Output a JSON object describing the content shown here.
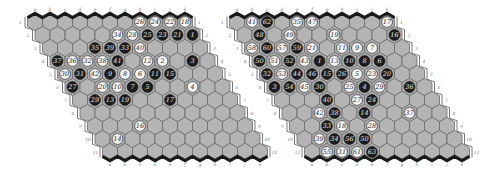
{
  "figure": {
    "boards": [
      {
        "id": "left",
        "size": 11,
        "origin_x": 35,
        "origin_y": 22,
        "columns": [
          "a",
          "b",
          "c",
          "d",
          "e",
          "f",
          "g",
          "h",
          "i",
          "j",
          "k"
        ],
        "rows": [
          "1",
          "2",
          "3",
          "4",
          "5",
          "6",
          "7",
          "8",
          "9",
          "10",
          "11"
        ],
        "stones": [
          {
            "row": 1,
            "col": "h",
            "color": "white",
            "n": "26"
          },
          {
            "row": 1,
            "col": "i",
            "color": "white",
            "n": "24"
          },
          {
            "row": 1,
            "col": "j",
            "color": "white",
            "n": "22"
          },
          {
            "row": 1,
            "col": "k",
            "color": "white",
            "n": "18"
          },
          {
            "row": 2,
            "col": "f",
            "color": "white",
            "n": "34"
          },
          {
            "row": 2,
            "col": "g",
            "color": "white",
            "n": "28"
          },
          {
            "row": 2,
            "col": "h",
            "color": "black",
            "n": "25"
          },
          {
            "row": 2,
            "col": "i",
            "color": "black",
            "n": "23"
          },
          {
            "row": 2,
            "col": "j",
            "color": "black",
            "n": "21"
          },
          {
            "row": 2,
            "col": "k",
            "color": "black",
            "n": "1"
          },
          {
            "row": 3,
            "col": "d",
            "color": "black",
            "n": "35"
          },
          {
            "row": 3,
            "col": "e",
            "color": "black",
            "n": "39"
          },
          {
            "row": 3,
            "col": "f",
            "color": "black",
            "n": "33"
          },
          {
            "row": 3,
            "col": "g",
            "color": "white",
            "n": "40"
          },
          {
            "row": 4,
            "col": "a",
            "color": "black",
            "n": "37"
          },
          {
            "row": 4,
            "col": "b",
            "color": "white",
            "n": "36"
          },
          {
            "row": 4,
            "col": "c",
            "color": "white",
            "n": "32"
          },
          {
            "row": 4,
            "col": "d",
            "color": "white",
            "n": "38"
          },
          {
            "row": 4,
            "col": "e",
            "color": "black",
            "n": "41"
          },
          {
            "row": 4,
            "col": "g",
            "color": "white",
            "n": "12"
          },
          {
            "row": 4,
            "col": "h",
            "color": "white",
            "n": "2"
          },
          {
            "row": 4,
            "col": "j",
            "color": "black",
            "n": "3"
          },
          {
            "row": 5,
            "col": "a",
            "color": "white",
            "n": "30"
          },
          {
            "row": 5,
            "col": "b",
            "color": "black",
            "n": "31"
          },
          {
            "row": 5,
            "col": "c",
            "color": "white",
            "n": "42"
          },
          {
            "row": 5,
            "col": "d",
            "color": "black",
            "n": "9"
          },
          {
            "row": 5,
            "col": "e",
            "color": "white",
            "n": "8"
          },
          {
            "row": 5,
            "col": "f",
            "color": "white",
            "n": "6"
          },
          {
            "row": 5,
            "col": "g",
            "color": "black",
            "n": "11"
          },
          {
            "row": 5,
            "col": "h",
            "color": "black",
            "n": "15"
          },
          {
            "row": 6,
            "col": "a",
            "color": "black",
            "n": "27"
          },
          {
            "row": 6,
            "col": "c",
            "color": "white",
            "n": "20"
          },
          {
            "row": 6,
            "col": "d",
            "color": "white",
            "n": "10"
          },
          {
            "row": 6,
            "col": "e",
            "color": "black",
            "n": "7"
          },
          {
            "row": 6,
            "col": "f",
            "color": "black",
            "n": "5"
          },
          {
            "row": 6,
            "col": "i",
            "color": "white",
            "n": "4"
          },
          {
            "row": 7,
            "col": "b",
            "color": "black",
            "n": "29"
          },
          {
            "row": 7,
            "col": "c",
            "color": "black",
            "n": "13"
          },
          {
            "row": 7,
            "col": "d",
            "color": "black",
            "n": "19"
          },
          {
            "row": 7,
            "col": "g",
            "color": "black",
            "n": "17"
          },
          {
            "row": 9,
            "col": "d",
            "color": "white",
            "n": "16"
          },
          {
            "row": 10,
            "col": "b",
            "color": "white",
            "n": "14"
          }
        ]
      },
      {
        "id": "right",
        "size": 11,
        "origin_x": 237,
        "origin_y": 22,
        "columns": [
          "a",
          "b",
          "c",
          "d",
          "e",
          "f",
          "g",
          "h",
          "i",
          "j",
          "k"
        ],
        "rows": [
          "1",
          "2",
          "3",
          "4",
          "5",
          "6",
          "7",
          "8",
          "9",
          "10",
          "11"
        ],
        "stones": [
          {
            "row": 1,
            "col": "b",
            "color": "white",
            "n": "41"
          },
          {
            "row": 1,
            "col": "c",
            "color": "black",
            "n": "62"
          },
          {
            "row": 1,
            "col": "e",
            "color": "white",
            "n": "35"
          },
          {
            "row": 1,
            "col": "f",
            "color": "white",
            "n": "47"
          },
          {
            "row": 1,
            "col": "k",
            "color": "white",
            "n": "17"
          },
          {
            "row": 2,
            "col": "b",
            "color": "black",
            "n": "48"
          },
          {
            "row": 2,
            "col": "d",
            "color": "white",
            "n": "49"
          },
          {
            "row": 2,
            "col": "g",
            "color": "white",
            "n": "19"
          },
          {
            "row": 2,
            "col": "k",
            "color": "black",
            "n": "16"
          },
          {
            "row": 3,
            "col": "a",
            "color": "white",
            "n": "58"
          },
          {
            "row": 3,
            "col": "b",
            "color": "black",
            "n": "60"
          },
          {
            "row": 3,
            "col": "c",
            "color": "white",
            "n": "57"
          },
          {
            "row": 3,
            "col": "d",
            "color": "black",
            "n": "59"
          },
          {
            "row": 3,
            "col": "e",
            "color": "white",
            "n": "21"
          },
          {
            "row": 3,
            "col": "g",
            "color": "white",
            "n": "11"
          },
          {
            "row": 3,
            "col": "h",
            "color": "white",
            "n": "9"
          },
          {
            "row": 3,
            "col": "i",
            "color": "white",
            "n": "7"
          },
          {
            "row": 4,
            "col": "a",
            "color": "black",
            "n": "50"
          },
          {
            "row": 4,
            "col": "b",
            "color": "white",
            "n": "51"
          },
          {
            "row": 4,
            "col": "c",
            "color": "black",
            "n": "52"
          },
          {
            "row": 4,
            "col": "d",
            "color": "white",
            "n": "43"
          },
          {
            "row": 4,
            "col": "e",
            "color": "black",
            "n": "1"
          },
          {
            "row": 4,
            "col": "f",
            "color": "white",
            "n": "13"
          },
          {
            "row": 4,
            "col": "g",
            "color": "black",
            "n": "10"
          },
          {
            "row": 4,
            "col": "h",
            "color": "black",
            "n": "8"
          },
          {
            "row": 4,
            "col": "i",
            "color": "black",
            "n": "6"
          },
          {
            "row": 5,
            "col": "a",
            "color": "black",
            "n": "32"
          },
          {
            "row": 5,
            "col": "b",
            "color": "white",
            "n": "53"
          },
          {
            "row": 5,
            "col": "c",
            "color": "black",
            "n": "44"
          },
          {
            "row": 5,
            "col": "d",
            "color": "black",
            "n": "46"
          },
          {
            "row": 5,
            "col": "e",
            "color": "black",
            "n": "15"
          },
          {
            "row": 5,
            "col": "f",
            "color": "black",
            "n": "26"
          },
          {
            "row": 5,
            "col": "g",
            "color": "white",
            "n": "5"
          },
          {
            "row": 5,
            "col": "h",
            "color": "white",
            "n": "23"
          },
          {
            "row": 5,
            "col": "i",
            "color": "black",
            "n": "20"
          },
          {
            "row": 6,
            "col": "a",
            "color": "black",
            "n": "3"
          },
          {
            "row": 6,
            "col": "b",
            "color": "black",
            "n": "54"
          },
          {
            "row": 6,
            "col": "c",
            "color": "white",
            "n": "45"
          },
          {
            "row": 6,
            "col": "d",
            "color": "black",
            "n": "30"
          },
          {
            "row": 6,
            "col": "f",
            "color": "white",
            "n": "25"
          },
          {
            "row": 6,
            "col": "g",
            "color": "black",
            "n": "4"
          },
          {
            "row": 6,
            "col": "h",
            "color": "white",
            "n": "29"
          },
          {
            "row": 6,
            "col": "j",
            "color": "black",
            "n": "36"
          },
          {
            "row": 7,
            "col": "d",
            "color": "black",
            "n": "40"
          },
          {
            "row": 7,
            "col": "f",
            "color": "white",
            "n": "27"
          },
          {
            "row": 7,
            "col": "g",
            "color": "black",
            "n": "24"
          },
          {
            "row": 8,
            "col": "c",
            "color": "white",
            "n": "42"
          },
          {
            "row": 8,
            "col": "d",
            "color": "black",
            "n": "38"
          },
          {
            "row": 8,
            "col": "f",
            "color": "black",
            "n": "14"
          },
          {
            "row": 8,
            "col": "i",
            "color": "white",
            "n": "37"
          },
          {
            "row": 9,
            "col": "c",
            "color": "black",
            "n": "33"
          },
          {
            "row": 9,
            "col": "d",
            "color": "white",
            "n": "18"
          },
          {
            "row": 9,
            "col": "f",
            "color": "white",
            "n": "28"
          },
          {
            "row": 10,
            "col": "b",
            "color": "white",
            "n": "39"
          },
          {
            "row": 10,
            "col": "c",
            "color": "black",
            "n": "34"
          },
          {
            "row": 10,
            "col": "d",
            "color": "black",
            "n": "56"
          },
          {
            "row": 10,
            "col": "e",
            "color": "black",
            "n": "50"
          },
          {
            "row": 11,
            "col": "b",
            "color": "white",
            "n": "55"
          },
          {
            "row": 11,
            "col": "c",
            "color": "white",
            "n": "31"
          },
          {
            "row": 11,
            "col": "d",
            "color": "white",
            "n": "61"
          },
          {
            "row": 11,
            "col": "e",
            "color": "black",
            "n": "63"
          }
        ]
      }
    ],
    "colors": {
      "cell": "#b4b4b4",
      "black_stone": "#1e1e1e",
      "white_stone": "#f4f4f4",
      "edge_dark": "#1a1a1a"
    }
  }
}
